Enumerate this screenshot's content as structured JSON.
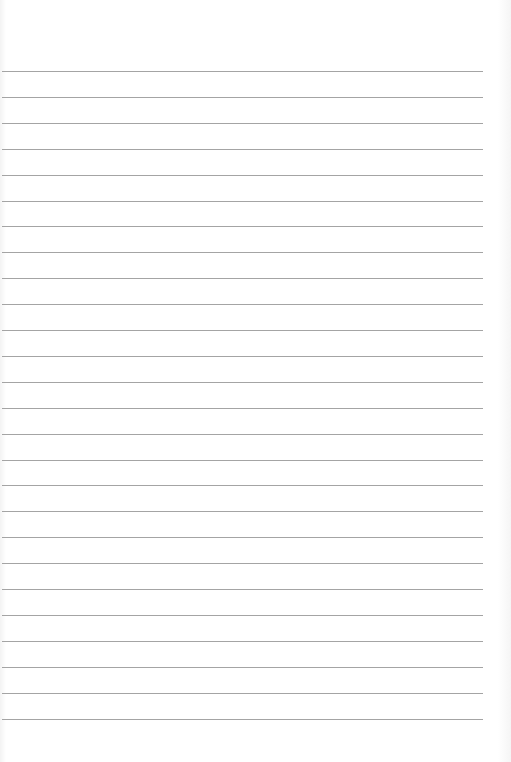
{
  "document": {
    "type": "lined-paper",
    "line_count": 26,
    "first_line_y": 71,
    "line_spacing": 25.9,
    "line_left": 2,
    "line_width": 481,
    "line_color": "#a4a4a4",
    "background_color": "#ffffff"
  }
}
